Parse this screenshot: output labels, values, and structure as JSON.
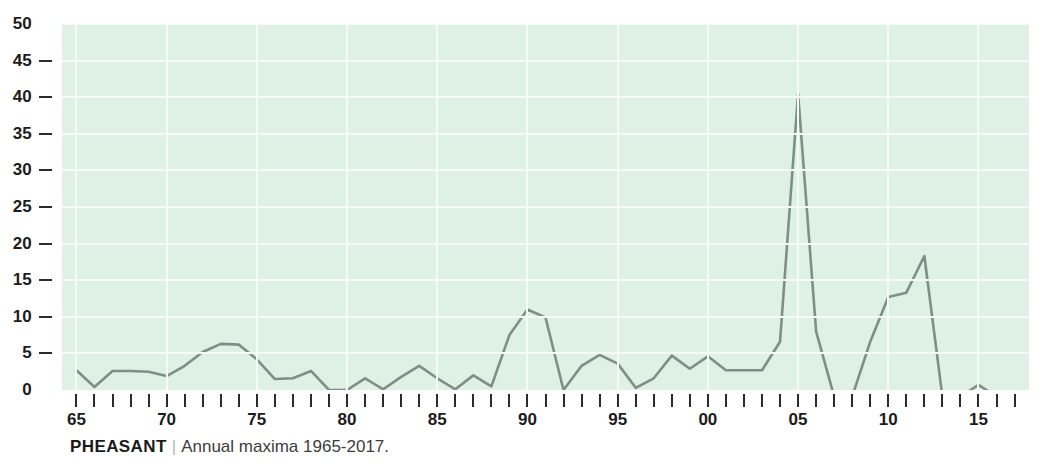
{
  "caption": {
    "name": "PHEASANT",
    "separator": "|",
    "text": "Annual maxima 1965-2017."
  },
  "colors": {
    "plot_background": "#dff0e4",
    "gridline": "#f4fbf6",
    "series_line": "#7d8f86",
    "axis_text": "#1c1c1c",
    "caption_text": "#3c3c3c"
  },
  "chart_data": {
    "type": "line",
    "title": "PHEASANT",
    "subtitle": "Annual maxima 1965-2017.",
    "xlabel": "",
    "ylabel": "",
    "xlim": [
      1964.2,
      2017.8
    ],
    "ylim": [
      0,
      50
    ],
    "ytick_values": [
      0,
      5,
      10,
      15,
      20,
      25,
      30,
      35,
      40,
      45,
      50
    ],
    "ytick_labels": [
      "0",
      "5",
      "10",
      "15",
      "20",
      "25",
      "30",
      "35",
      "40",
      "45",
      "50"
    ],
    "xtick_values": [
      1965,
      1970,
      1975,
      1980,
      1985,
      1990,
      1995,
      2000,
      2005,
      2010,
      2015
    ],
    "xtick_labels": [
      "65",
      "70",
      "75",
      "80",
      "85",
      "90",
      "95",
      "00",
      "05",
      "10",
      "15"
    ],
    "xtick_minor_every": 1,
    "grid": true,
    "legend": "none",
    "series": [
      {
        "name": "Annual maxima",
        "x": [
          1965,
          1966,
          1967,
          1968,
          1969,
          1970,
          1971,
          1972,
          1973,
          1974,
          1975,
          1976,
          1977,
          1978,
          1979,
          1980,
          1981,
          1982,
          1983,
          1984,
          1985,
          1986,
          1987,
          1988,
          1989,
          1990,
          1991,
          1992,
          1993,
          1994,
          1995,
          1996,
          1997,
          1998,
          1999,
          2000,
          2001,
          2002,
          2003,
          2004,
          2005,
          2006,
          2007,
          2008,
          2009,
          2010,
          2011,
          2012,
          2013,
          2014,
          2015,
          2016,
          2017
        ],
        "values": [
          2.7,
          0.4,
          2.6,
          2.6,
          2.5,
          1.9,
          3.3,
          5.2,
          6.3,
          6.2,
          4.2,
          1.5,
          1.6,
          2.6,
          0.0,
          0.0,
          1.6,
          0.1,
          1.8,
          3.3,
          1.6,
          0.1,
          2.0,
          0.5,
          7.5,
          11.0,
          9.9,
          0.0,
          3.3,
          4.8,
          3.6,
          0.3,
          1.6,
          4.7,
          2.9,
          4.6,
          2.7,
          2.7,
          2.7,
          6.6,
          40.5,
          8.0,
          -0.9,
          -0.9,
          6.6,
          12.7,
          13.3,
          18.3,
          -0.9,
          -0.9,
          0.7,
          -0.9,
          -0.9
        ]
      }
    ]
  }
}
